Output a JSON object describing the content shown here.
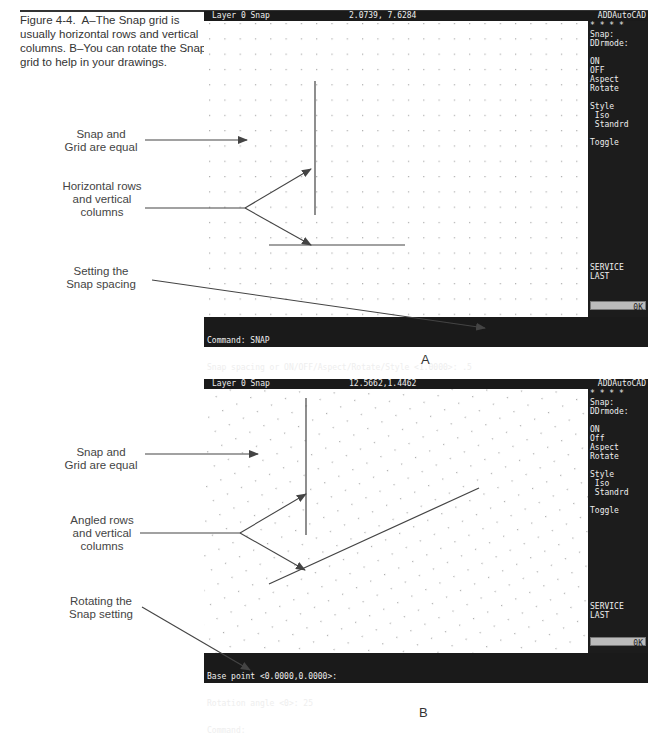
{
  "caption": {
    "figure": "Figure 4-4.",
    "text": "A–The Snap grid is usually horizontal rows and vertical columns. B–You can rotate the Snap grid to help in your drawings."
  },
  "panel_a": {
    "letter": "A",
    "status": {
      "layer": "Layer 0 Snap",
      "coords": "2.0739, 7.6284",
      "title": "ADDAutoCAD"
    },
    "menu": [
      "* * * *",
      "Snap:",
      "DDrmode:",
      "",
      "ON",
      "OFF",
      "Aspect",
      "Rotate",
      "",
      "Style",
      " Iso",
      " Standrd",
      "",
      "Toggle"
    ],
    "menu_bottom": [
      "SERVICE",
      "LAST"
    ],
    "ok_label": "0K",
    "command_lines": [
      "Command: SNAP",
      "Snap spacing or ON/OFF/Aspect/Rotate/Style <1.0000>: .5",
      "Command:"
    ],
    "callouts": [
      {
        "text": "Snap and\nGrid are equal"
      },
      {
        "text": "Horizontal rows\nand vertical\ncolumns"
      },
      {
        "text": "Setting the\nSnap spacing"
      }
    ]
  },
  "panel_b": {
    "letter": "B",
    "status": {
      "layer": "Layer 0 Snap",
      "coords": "12.5662,1.4462",
      "title": "ADDAutoCAD"
    },
    "menu": [
      "* * * *",
      "Snap:",
      "DDrmode:",
      "",
      "ON",
      "Off",
      "Aspect",
      "Rotate",
      "",
      "Style",
      " Iso",
      " Standrd",
      "",
      "Toggle"
    ],
    "menu_bottom": [
      "SERVICE",
      "LAST"
    ],
    "ok_label": "0K",
    "command_lines": [
      "Base point <0.0000,0.0000>:",
      "Rotation angle <0>: 25",
      "Command:"
    ],
    "callouts": [
      {
        "text": "Snap and\nGrid are equal"
      },
      {
        "text": "Angled rows\nand vertical\ncolumns"
      },
      {
        "text": "Rotating the\nSnap setting"
      }
    ]
  }
}
